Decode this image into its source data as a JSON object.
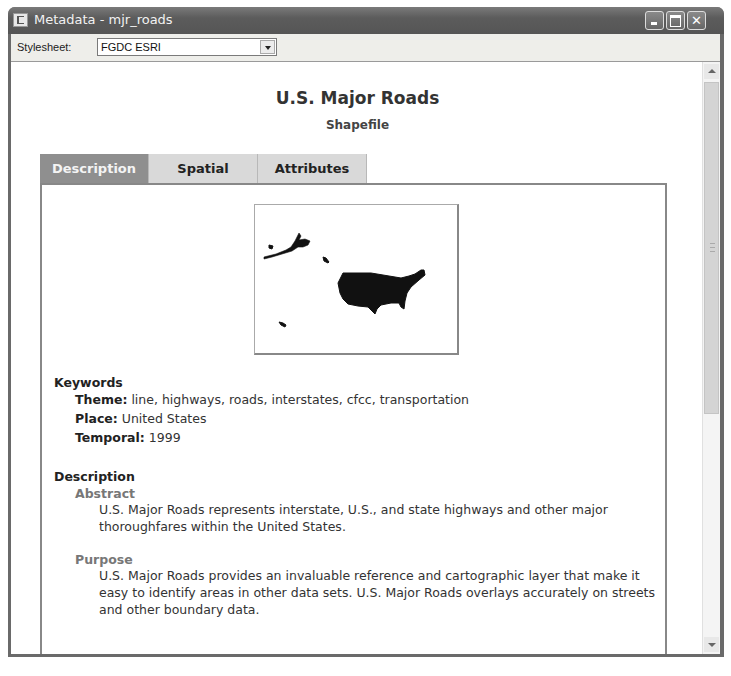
{
  "window": {
    "title": "Metadata - mjr_roads",
    "controls": [
      "minimize",
      "maximize",
      "close"
    ]
  },
  "toolbar": {
    "stylesheet_label": "Stylesheet:",
    "stylesheet_value": "FGDC ESRI"
  },
  "document": {
    "title": "U.S. Major Roads",
    "subtitle": "Shapefile",
    "tabs": [
      {
        "label": "Description",
        "active": true
      },
      {
        "label": "Spatial",
        "active": false
      },
      {
        "label": "Attributes",
        "active": false
      }
    ],
    "thumbnail_alt": "map-thumbnail-united-states",
    "keywords": {
      "heading": "Keywords",
      "theme_label": "Theme:",
      "theme_value": "line, highways, roads, interstates, cfcc, transportation",
      "place_label": "Place:",
      "place_value": "United States",
      "temporal_label": "Temporal:",
      "temporal_value": "1999"
    },
    "description": {
      "heading": "Description",
      "abstract_label": "Abstract",
      "abstract_text": "U.S. Major Roads represents interstate, U.S., and state highways and other major thoroughfares within the United States.",
      "purpose_label": "Purpose",
      "purpose_text": "U.S. Major Roads provides an invaluable reference and cartographic layer that make it easy to identify areas in other data sets. U.S. Major Roads overlays accurately on streets and other boundary data."
    }
  },
  "colors": {
    "titlebar": "#5c5c5c",
    "active_tab": "#8f8f8f",
    "inactive_tab": "#d9d9d9"
  }
}
